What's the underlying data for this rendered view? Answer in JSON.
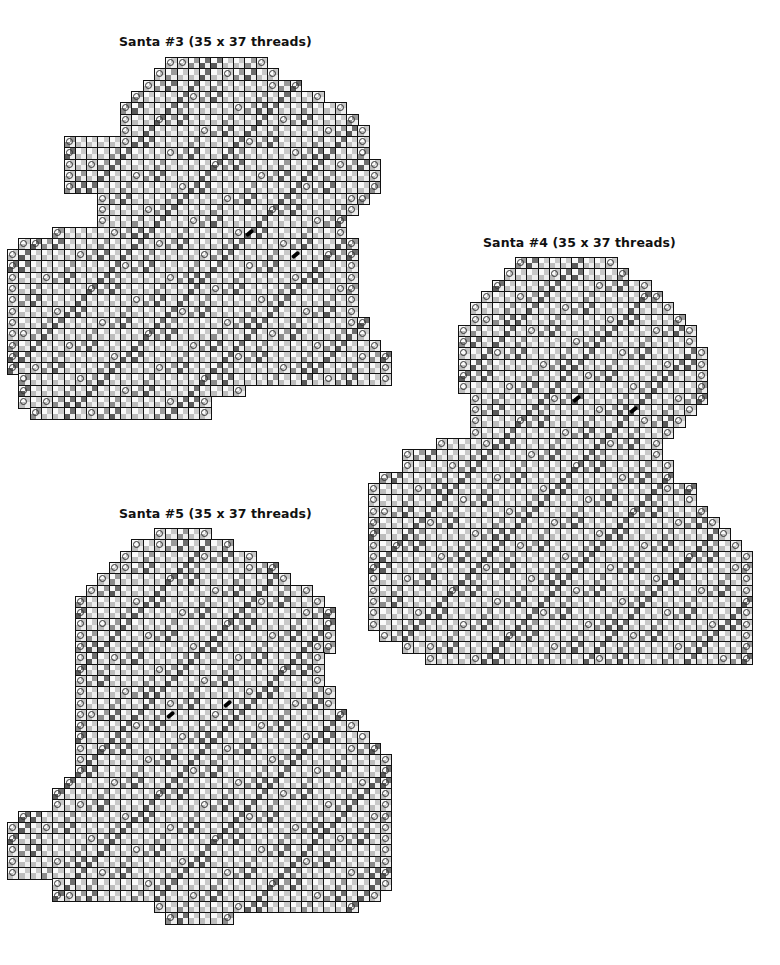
{
  "page": {
    "background": "#ffffff",
    "grid_line_color": "#111111"
  },
  "charts": [
    {
      "id": "santa3",
      "title": "Santa #3 (35 x 37 threads)",
      "title_pos": [
        119,
        34
      ],
      "origin": [
        7,
        57
      ],
      "cell": 11.3,
      "rows": [
        [
          14,
          22
        ],
        [
          13,
          23
        ],
        [
          12,
          25
        ],
        [
          11,
          27
        ],
        [
          10,
          29
        ],
        [
          10,
          30
        ],
        [
          10,
          31
        ],
        [
          5,
          31
        ],
        [
          5,
          31
        ],
        [
          5,
          32
        ],
        [
          5,
          32
        ],
        [
          5,
          32
        ],
        [
          8,
          31
        ],
        [
          8,
          30
        ],
        [
          8,
          29
        ],
        [
          4,
          29
        ],
        [
          1,
          30
        ],
        [
          0,
          30
        ],
        [
          0,
          30
        ],
        [
          0,
          30
        ],
        [
          0,
          30
        ],
        [
          0,
          30
        ],
        [
          0,
          30
        ],
        [
          0,
          31
        ],
        [
          0,
          31
        ],
        [
          0,
          32
        ],
        [
          0,
          33
        ],
        [
          0,
          33
        ],
        [
          1,
          33
        ],
        [
          1,
          20
        ],
        [
          1,
          17
        ],
        [
          2,
          17
        ]
      ],
      "eyes": [
        [
          21,
          15
        ],
        [
          25,
          17
        ]
      ]
    },
    {
      "id": "santa4",
      "title": "Santa #4 (35 x 37 threads)",
      "title_pos": [
        483,
        235
      ],
      "origin": [
        368,
        257
      ],
      "cell": 11.3,
      "rows": [
        [
          13,
          21
        ],
        [
          12,
          22
        ],
        [
          11,
          24
        ],
        [
          10,
          25
        ],
        [
          9,
          26
        ],
        [
          9,
          27
        ],
        [
          8,
          28
        ],
        [
          8,
          28
        ],
        [
          8,
          29
        ],
        [
          8,
          29
        ],
        [
          8,
          29
        ],
        [
          8,
          29
        ],
        [
          9,
          29
        ],
        [
          9,
          28
        ],
        [
          9,
          27
        ],
        [
          9,
          26
        ],
        [
          6,
          25
        ],
        [
          3,
          25
        ],
        [
          3,
          26
        ],
        [
          1,
          26
        ],
        [
          0,
          28
        ],
        [
          0,
          28
        ],
        [
          0,
          29
        ],
        [
          0,
          30
        ],
        [
          0,
          31
        ],
        [
          0,
          32
        ],
        [
          0,
          33
        ],
        [
          0,
          33
        ],
        [
          0,
          33
        ],
        [
          0,
          33
        ],
        [
          0,
          33
        ],
        [
          0,
          33
        ],
        [
          0,
          33
        ],
        [
          1,
          33
        ],
        [
          3,
          33
        ],
        [
          5,
          33
        ]
      ],
      "eyes": [
        [
          18,
          12
        ],
        [
          23,
          13
        ]
      ]
    },
    {
      "id": "santa5",
      "title": "Santa #5 (35 x 37 threads)",
      "title_pos": [
        119,
        506
      ],
      "origin": [
        7,
        528
      ],
      "cell": 11.3,
      "rows": [
        [
          13,
          17
        ],
        [
          11,
          19
        ],
        [
          10,
          21
        ],
        [
          9,
          23
        ],
        [
          8,
          24
        ],
        [
          7,
          26
        ],
        [
          6,
          27
        ],
        [
          6,
          28
        ],
        [
          6,
          28
        ],
        [
          6,
          28
        ],
        [
          6,
          28
        ],
        [
          6,
          27
        ],
        [
          6,
          27
        ],
        [
          6,
          27
        ],
        [
          6,
          28
        ],
        [
          6,
          28
        ],
        [
          6,
          29
        ],
        [
          6,
          30
        ],
        [
          6,
          31
        ],
        [
          6,
          32
        ],
        [
          6,
          33
        ],
        [
          6,
          33
        ],
        [
          5,
          33
        ],
        [
          4,
          33
        ],
        [
          4,
          33
        ],
        [
          1,
          33
        ],
        [
          0,
          33
        ],
        [
          0,
          33
        ],
        [
          0,
          33
        ],
        [
          0,
          33
        ],
        [
          0,
          33
        ],
        [
          4,
          33
        ],
        [
          4,
          32
        ],
        [
          13,
          30
        ],
        [
          14,
          19
        ]
      ],
      "eyes": [
        [
          14,
          16
        ],
        [
          19,
          15
        ]
      ]
    }
  ]
}
